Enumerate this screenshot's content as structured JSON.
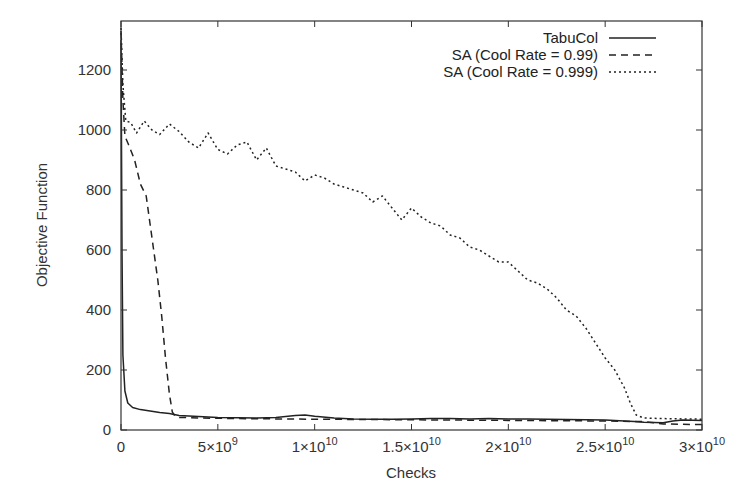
{
  "chart_data": {
    "type": "line",
    "title": "",
    "xlabel": "Checks",
    "ylabel": "Objective Function",
    "xlim": [
      0,
      30000000000
    ],
    "ylim": [
      0,
      1350
    ],
    "grid": false,
    "legend_position": "top-right",
    "x_ticks": [
      {
        "value": 0,
        "label": "0",
        "sup": ""
      },
      {
        "value": 5000000000,
        "label": "5×10",
        "sup": "9"
      },
      {
        "value": 10000000000,
        "label": "1×10",
        "sup": "10"
      },
      {
        "value": 15000000000,
        "label": "1.5×10",
        "sup": "10"
      },
      {
        "value": 20000000000,
        "label": "2×10",
        "sup": "10"
      },
      {
        "value": 25000000000,
        "label": "2.5×10",
        "sup": "10"
      },
      {
        "value": 30000000000,
        "label": "3×10",
        "sup": "10"
      }
    ],
    "y_ticks": [
      {
        "value": 0,
        "label": "0"
      },
      {
        "value": 200,
        "label": "200"
      },
      {
        "value": 400,
        "label": "400"
      },
      {
        "value": 600,
        "label": "600"
      },
      {
        "value": 800,
        "label": "800"
      },
      {
        "value": 1000,
        "label": "1000"
      },
      {
        "value": 1200,
        "label": "1200"
      }
    ],
    "series": [
      {
        "name": "TabuCol",
        "style": "solid",
        "x": [
          0,
          50000000.0,
          100000000.0,
          200000000.0,
          350000000.0,
          600000000.0,
          1000000000.0,
          1500000000.0,
          2000000000.0,
          2500000000.0,
          3000000000.0,
          4000000000.0,
          5000000000.0,
          6000000000.0,
          7000000000.0,
          8000000000.0,
          9000000000.0,
          9500000000.0,
          10000000000.0,
          11000000000.0,
          12000000000.0,
          13000000000.0,
          14000000000.0,
          15000000000.0,
          16000000000.0,
          17000000000.0,
          18000000000.0,
          19000000000.0,
          20000000000.0,
          21000000000.0,
          22000000000.0,
          23000000000.0,
          24000000000.0,
          25000000000.0,
          26000000000.0,
          26500000000.0,
          27000000000.0,
          28000000000.0,
          28500000000.0,
          29000000000.0,
          30000000000.0
        ],
        "y": [
          1300,
          600,
          250,
          130,
          90,
          75,
          68,
          63,
          58,
          55,
          48,
          45,
          42,
          41,
          40,
          42,
          48,
          50,
          46,
          40,
          37,
          36,
          36,
          37,
          38,
          38,
          37,
          38,
          37,
          37,
          36,
          35,
          34,
          33,
          30,
          28,
          26,
          24,
          30,
          33,
          32
        ]
      },
      {
        "name": "SA (Cool Rate = 0.99)",
        "style": "dashed",
        "x": [
          0,
          100000000.0,
          200000000.0,
          400000000.0,
          700000000.0,
          1000000000.0,
          1300000000.0,
          1600000000.0,
          1900000000.0,
          2100000000.0,
          2300000000.0,
          2500000000.0,
          2650000000.0,
          2800000000.0,
          3000000000.0,
          4000000000.0,
          6000000000.0,
          10000000000.0,
          15000000000.0,
          20000000000.0,
          25000000000.0,
          27000000000.0,
          28000000000.0,
          30000000000.0
        ],
        "y": [
          1330,
          1100,
          980,
          950,
          900,
          820,
          780,
          640,
          500,
          380,
          240,
          120,
          60,
          45,
          42,
          40,
          38,
          36,
          34,
          32,
          30,
          28,
          20,
          18
        ]
      },
      {
        "name": "SA (Cool Rate = 0.999)",
        "style": "dotted",
        "x": [
          0,
          100000000.0,
          250000000.0,
          500000000.0,
          800000000.0,
          1200000000.0,
          1600000000.0,
          2000000000.0,
          2500000000.0,
          3000000000.0,
          3500000000.0,
          4000000000.0,
          4500000000.0,
          5000000000.0,
          5500000000.0,
          6000000000.0,
          6500000000.0,
          7000000000.0,
          7500000000.0,
          8000000000.0,
          8500000000.0,
          9000000000.0,
          9500000000.0,
          10000000000.0,
          10500000000.0,
          11000000000.0,
          11500000000.0,
          12000000000.0,
          12500000000.0,
          13000000000.0,
          13500000000.0,
          14000000000.0,
          14500000000.0,
          15000000000.0,
          15500000000.0,
          16000000000.0,
          16500000000.0,
          17000000000.0,
          17500000000.0,
          18000000000.0,
          18500000000.0,
          19000000000.0,
          19500000000.0,
          20000000000.0,
          20500000000.0,
          21000000000.0,
          21500000000.0,
          22000000000.0,
          22500000000.0,
          23000000000.0,
          23500000000.0,
          24000000000.0,
          24500000000.0,
          25000000000.0,
          25500000000.0,
          26000000000.0,
          26300000000.0,
          26600000000.0,
          27000000000.0,
          28000000000.0,
          30000000000.0
        ],
        "y": [
          1340,
          1150,
          1030,
          1025,
          990,
          1030,
          1000,
          985,
          1020,
          995,
          960,
          940,
          990,
          935,
          920,
          950,
          960,
          900,
          940,
          880,
          870,
          860,
          830,
          850,
          840,
          820,
          810,
          800,
          790,
          760,
          780,
          740,
          700,
          740,
          710,
          690,
          680,
          650,
          640,
          610,
          600,
          580,
          560,
          560,
          530,
          500,
          490,
          470,
          440,
          400,
          380,
          340,
          290,
          240,
          200,
          140,
          90,
          50,
          40,
          38,
          36
        ]
      }
    ]
  }
}
